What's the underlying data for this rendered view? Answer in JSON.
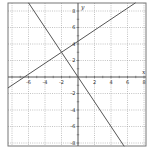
{
  "chart_data": {
    "type": "line",
    "title": "",
    "xlabel": "x",
    "ylabel": "y",
    "xlim": [
      -8.5,
      8.25
    ],
    "ylim": [
      -8.4,
      9
    ],
    "grid": true,
    "grid_style": "dotted",
    "x_ticks": [
      -6,
      -4,
      -2,
      2,
      4,
      6,
      8
    ],
    "y_ticks": [
      8,
      6,
      4,
      2,
      -2,
      -4,
      -6,
      -8
    ],
    "x_tick_labels": [
      "-6",
      "-4",
      "-2",
      "2",
      "4",
      "6",
      "8"
    ],
    "y_tick_labels": [
      "8",
      "6",
      "4",
      "2",
      "-2",
      "-4",
      "-6",
      "-8"
    ],
    "series": [
      {
        "name": "increasing line",
        "equation": "y = (2/3)x + 13/3",
        "points": [
          [
            -8.5,
            -1.33
          ],
          [
            -6.5,
            0
          ],
          [
            -2,
            3
          ],
          [
            0,
            4.33
          ],
          [
            6.98,
            9
          ]
        ]
      },
      {
        "name": "decreasing line",
        "equation": "y = -1.5x",
        "points": [
          [
            -6,
            9
          ],
          [
            -2,
            3
          ],
          [
            0,
            0
          ],
          [
            5.6,
            -8.4
          ]
        ]
      }
    ],
    "intersection": [
      -2,
      3
    ],
    "colors": {
      "line": "#555555",
      "axis": "#555555",
      "grid": "#9a9a9a",
      "border": "#777777"
    }
  }
}
